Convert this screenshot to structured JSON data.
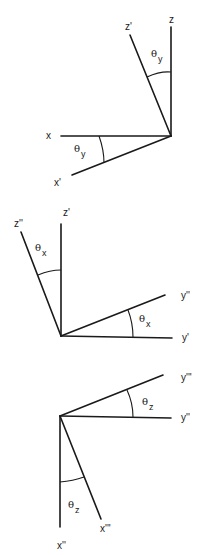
{
  "figure": {
    "panels": [
      {
        "name": "rotation-about-y",
        "axes": [
          {
            "id": "z",
            "label": "z"
          },
          {
            "id": "z_prime",
            "label": "z'"
          },
          {
            "id": "x",
            "label": "x"
          },
          {
            "id": "x_prime",
            "label": "x'"
          }
        ],
        "angles": [
          {
            "symbol": "θ",
            "subscript": "y",
            "between": "z-z'"
          },
          {
            "symbol": "θ",
            "subscript": "y",
            "between": "x-x'"
          }
        ]
      },
      {
        "name": "rotation-about-x",
        "axes": [
          {
            "id": "z_prime",
            "label": "z'"
          },
          {
            "id": "z_double_prime",
            "label": "z''"
          },
          {
            "id": "y_prime",
            "label": "y'"
          },
          {
            "id": "y_double_prime",
            "label": "y''"
          }
        ],
        "angles": [
          {
            "symbol": "θ",
            "subscript": "x",
            "between": "z'-z''"
          },
          {
            "symbol": "θ",
            "subscript": "x",
            "between": "y'-y''"
          }
        ]
      },
      {
        "name": "rotation-about-z",
        "axes": [
          {
            "id": "y_triple_prime",
            "label": "y'''"
          },
          {
            "id": "y_double_prime",
            "label": "y''"
          },
          {
            "id": "x_double_prime",
            "label": "x''"
          },
          {
            "id": "x_triple_prime",
            "label": "x'''"
          }
        ],
        "angles": [
          {
            "symbol": "θ",
            "subscript": "z",
            "between": "y''-y'''"
          },
          {
            "symbol": "θ",
            "subscript": "z",
            "between": "x''-x'''"
          }
        ]
      }
    ]
  }
}
